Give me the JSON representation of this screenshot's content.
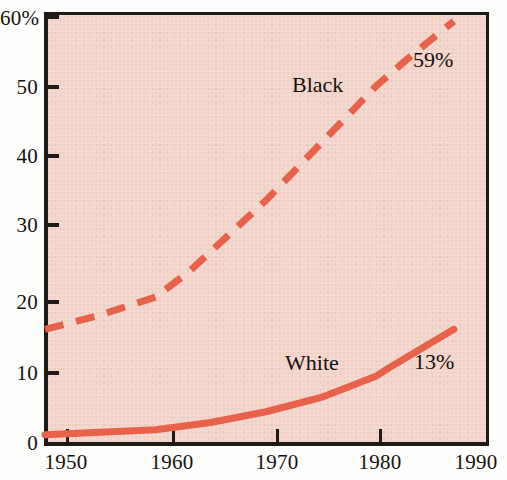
{
  "chart_data": {
    "type": "line",
    "title": "",
    "subtitle": "",
    "xlabel": "",
    "ylabel": "",
    "xlim": [
      1950,
      1990
    ],
    "ylim": [
      0,
      60
    ],
    "grid": false,
    "legend_position": "inline-labels",
    "x_ticks": [
      "1950",
      "1960",
      "1970",
      "1980",
      "1990"
    ],
    "x_tick_values": [
      1950,
      1960,
      1970,
      1980,
      1990
    ],
    "y_ticks": [
      "0",
      "10",
      "20",
      "30",
      "40",
      "50",
      "60%"
    ],
    "y_tick_values": [
      0,
      10,
      20,
      30,
      40,
      50,
      60
    ],
    "series": [
      {
        "name": "Black",
        "style": "dashed",
        "color": "#e8614a",
        "inline_label": "Black",
        "end_label": "59%",
        "x": [
          1950,
          1955,
          1960,
          1963,
          1970,
          1975,
          1980,
          1983,
          1987
        ],
        "values": [
          16,
          18,
          20.5,
          24,
          34,
          42,
          50,
          54,
          59
        ]
      },
      {
        "name": "White",
        "style": "solid",
        "color": "#e8614a",
        "inline_label": "White",
        "end_label": "13%",
        "x": [
          1950,
          1960,
          1965,
          1970,
          1975,
          1980,
          1981,
          1987
        ],
        "values": [
          1.3,
          2,
          3,
          4.5,
          6.5,
          9.5,
          10.5,
          16
        ]
      }
    ],
    "annotations": [
      {
        "text": "Black",
        "x_px": 292,
        "y_px": 74
      },
      {
        "text": "59%",
        "x_px": 413,
        "y_px": 49
      },
      {
        "text": "White",
        "x_px": 285,
        "y_px": 352
      },
      {
        "text": "13%",
        "x_px": 414,
        "y_px": 351
      }
    ],
    "colors": {
      "line": "#e8614a",
      "plot_background": "#f2d3c9",
      "axis": "#1d1a17",
      "text": "#16120f",
      "page_background": "#fdfdfc"
    }
  },
  "y_axis": {
    "labels": [
      {
        "text": "60%",
        "top": 8
      },
      {
        "text": "50",
        "top": 77
      },
      {
        "text": "40",
        "top": 146
      },
      {
        "text": "30",
        "top": 215
      },
      {
        "text": "20",
        "top": 292
      },
      {
        "text": "10",
        "top": 363
      },
      {
        "text": "0",
        "top": 433
      }
    ]
  },
  "x_axis": {
    "labels": [
      {
        "text": "1950",
        "left": 25
      },
      {
        "text": "1960",
        "left": 131
      },
      {
        "text": "1970",
        "left": 236
      },
      {
        "text": "1980",
        "left": 339
      },
      {
        "text": "1990",
        "left": 446
      }
    ]
  }
}
